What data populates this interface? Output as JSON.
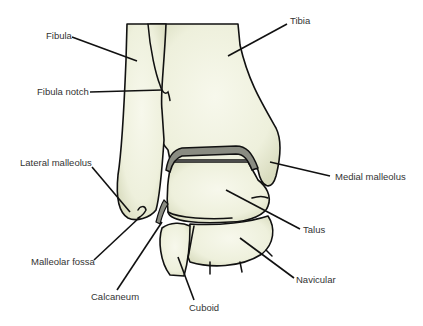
{
  "diagram": {
    "colors": {
      "bone_fill": "#eef0dc",
      "bone_shade": "#d9dcbf",
      "cartilage": "#8a8c82",
      "outline": "#111111",
      "label_text": "#333333"
    },
    "labels": {
      "fibula": "Fibula",
      "fibula_notch": "Fibula notch",
      "lateral_malleolus": "Lateral malleolus",
      "malleolar_fossa": "Malleolar fossa",
      "calcaneum": "Calcaneum",
      "cuboid": "Cuboid",
      "tibia": "Tibia",
      "medial_malleolus": "Medial malleolus",
      "talus": "Talus",
      "navicular": "Navicular"
    }
  }
}
